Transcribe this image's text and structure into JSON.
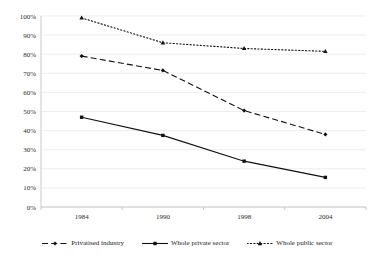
{
  "chart_data": {
    "type": "line",
    "title": "",
    "subtitle": "",
    "xlabel": "",
    "ylabel": "",
    "categories": [
      "1984",
      "1990",
      "1998",
      "2004"
    ],
    "ylim": [
      0,
      100
    ],
    "yticks": [
      "0%",
      "10%",
      "20%",
      "30%",
      "40%",
      "50%",
      "60%",
      "70%",
      "80%",
      "90%",
      "100%"
    ],
    "ytick_values": [
      0,
      10,
      20,
      30,
      40,
      50,
      60,
      70,
      80,
      90,
      100
    ],
    "grid": "horizontal",
    "legend_position": "bottom",
    "series": [
      {
        "name": "Privatised industry",
        "values": [
          79,
          71.5,
          50.5,
          38
        ],
        "line_style": "dashed",
        "marker": "diamond",
        "color": "#111111"
      },
      {
        "name": "Whole private sector",
        "values": [
          47,
          37.5,
          24,
          15.5
        ],
        "line_style": "solid",
        "marker": "square",
        "color": "#111111"
      },
      {
        "name": "Whole public sector",
        "values": [
          99,
          86,
          83,
          81.5
        ],
        "line_style": "dotted",
        "marker": "triangle",
        "color": "#111111"
      }
    ]
  },
  "legend": {
    "items": [
      {
        "label": "Privatised industry"
      },
      {
        "label": "Whole private sector"
      },
      {
        "label": "Whole public sector"
      }
    ]
  }
}
